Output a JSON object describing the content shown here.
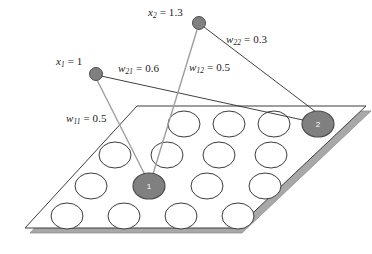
{
  "figure": {
    "title": "",
    "colors": {
      "node_fill": "#808080",
      "node_stroke": "#4d4d4d",
      "plane_stroke": "#3c3c3c",
      "plane_fill": "#ffffff",
      "plane_shadow": "#9a9a9a",
      "unit_stroke": "#3c3c3c",
      "unit_fill": "#ffffff",
      "connection_dark": "#2b2b2b",
      "connection_light": "#9e9e9e",
      "label_color": "#1a1a1a",
      "node_number_color": "#ffffff"
    }
  },
  "input_nodes": [
    {
      "id": "x1",
      "label_prefix": "x",
      "label_sub": "1",
      "label_eq": " = ",
      "value": "1",
      "label_full": "x1 = 1",
      "cx": 96,
      "cy": 74,
      "r": 6.5
    },
    {
      "id": "x2",
      "label_prefix": "x",
      "label_sub": "2",
      "label_eq": " = ",
      "value": "1.3",
      "label_full": "x2 = 1.3",
      "cx": 199,
      "cy": 23,
      "r": 6.5
    }
  ],
  "weights": [
    {
      "id": "w11",
      "label_prefix": "w",
      "label_sub": "11",
      "label_eq": " = ",
      "value": "0.5",
      "label_full": "w11 = 0.5",
      "from": "x1",
      "to": "unit1"
    },
    {
      "id": "w21",
      "label_prefix": "w",
      "label_sub": "21",
      "label_eq": " = ",
      "value": "0.6",
      "label_full": "w21 = 0.6",
      "from": "x1",
      "to": "unit2"
    },
    {
      "id": "w12",
      "label_prefix": "w",
      "label_sub": "12",
      "label_eq": " = ",
      "value": "0.5",
      "label_full": "w12 = 0.5",
      "from": "x2",
      "to": "unit1"
    },
    {
      "id": "w22",
      "label_prefix": "w",
      "label_sub": "22",
      "label_eq": " = ",
      "value": "0.3",
      "label_full": "w22 = 0.3",
      "from": "x2",
      "to": "unit2"
    }
  ],
  "map_units": [
    {
      "id": "unit1",
      "number": "1",
      "highlighted": true,
      "row": 3,
      "col": 2,
      "cx": 149,
      "cy": 186
    },
    {
      "id": "unit2",
      "number": "2",
      "highlighted": true,
      "row": 1,
      "col": 4,
      "cx": 318,
      "cy": 124
    }
  ],
  "grid": {
    "rows": 4,
    "cols": 4,
    "unit_rx": 16,
    "unit_ry": 13
  },
  "plane": {
    "corners": [
      [
        137,
        106
      ],
      [
        366,
        106
      ],
      [
        237,
        228
      ],
      [
        25,
        228
      ]
    ],
    "shadow_offset": 5
  }
}
